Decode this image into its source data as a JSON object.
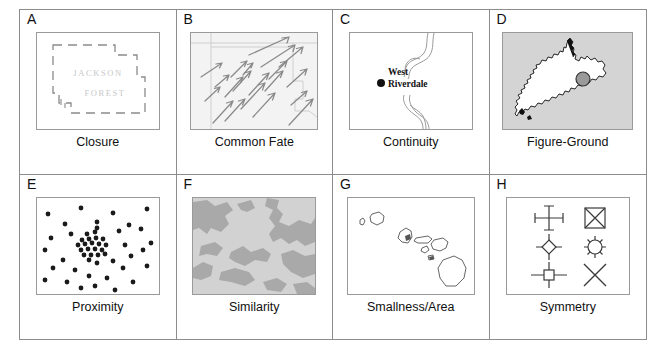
{
  "figure": {
    "panels": [
      {
        "letter": "A",
        "caption": "Closure",
        "graphic": "dashed-forest-boundary",
        "labels": [
          "JACKSON",
          "FOREST"
        ],
        "colors": {
          "boundary": "#8a8a8a",
          "label": "#c8c8c8"
        }
      },
      {
        "letter": "B",
        "caption": "Common Fate",
        "graphic": "arrow-field",
        "arrow_count": 20,
        "arrow_direction": "up-right",
        "colors": {
          "arrow": "#8a8a8a",
          "basemap": "#cfcfcf"
        }
      },
      {
        "letter": "C",
        "caption": "Continuity",
        "graphic": "meandering-river",
        "labels": [
          "West",
          "Riverdale"
        ],
        "marker": "filled-dot",
        "colors": {
          "river": "#9a9a9a",
          "label": "#111111"
        }
      },
      {
        "letter": "D",
        "caption": "Figure-Ground",
        "graphic": "new-zealand-map",
        "marker": "circle-symbol",
        "colors": {
          "ground": "#d4d4d4",
          "figure": "#ffffff",
          "outline": "#111111",
          "marker": "#9a9a9a"
        }
      },
      {
        "letter": "E",
        "caption": "Proximity",
        "graphic": "dot-distribution",
        "scattered_dots": 30,
        "cluster_dots": 21,
        "colors": {
          "dot": "#1a1a1a"
        }
      },
      {
        "letter": "F",
        "caption": "Similarity",
        "graphic": "two-tone-land-cover",
        "colors": {
          "light": "#d2d2d2",
          "dark": "#a9a9a9"
        }
      },
      {
        "letter": "G",
        "caption": "Smallness/Area",
        "graphic": "hawaiian-islands",
        "island_count": 8,
        "colors": {
          "outline": "#555555"
        }
      },
      {
        "letter": "H",
        "caption": "Symmetry",
        "graphic": "symmetric-map-symbols",
        "symbols": [
          "cross-with-endcaps",
          "square-with-x",
          "diamond-with-cross-arms",
          "sunburst-circle",
          "cross-with-square-center",
          "saltire-x"
        ],
        "colors": {
          "symbol": "#3a3a3a"
        }
      }
    ]
  }
}
